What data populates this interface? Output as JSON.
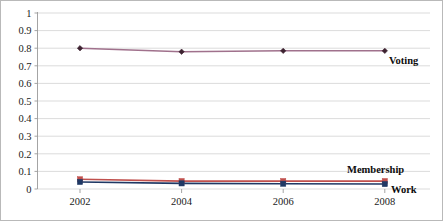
{
  "chart_data": {
    "type": "line",
    "title": "",
    "subtitle": "",
    "xlabel": "",
    "ylabel": "",
    "categories": [
      "2002",
      "2004",
      "2006",
      "2008"
    ],
    "ylim": [
      0,
      1
    ],
    "ytick_labels": [
      "0",
      "0.1",
      "0.2",
      "0.3",
      "0.4",
      "0.5",
      "0.6",
      "0.7",
      "0.8",
      "0.9",
      "1"
    ],
    "ytick_values": [
      0,
      0.1,
      0.2,
      0.3,
      0.4,
      0.5,
      0.6,
      0.7,
      0.8,
      0.9,
      1
    ],
    "grid": "horizontal",
    "legend_position": "inline-right-annotations",
    "series": [
      {
        "name": "Voting",
        "color": "#a0718c",
        "marker": "diamond",
        "marker_color": "#3d2230",
        "values": [
          0.8,
          0.78,
          0.785,
          0.785
        ]
      },
      {
        "name": "Membership",
        "color": "#c0504d",
        "marker": "square",
        "marker_color": "#c0504d",
        "values": [
          0.055,
          0.045,
          0.045,
          0.045
        ]
      },
      {
        "name": "Work",
        "color": "#1f3864",
        "marker": "square",
        "marker_color": "#1f3864",
        "values": [
          0.04,
          0.032,
          0.03,
          0.028
        ]
      }
    ],
    "annotations": [
      {
        "text": "Voting",
        "series": "Voting"
      },
      {
        "text": "Membership",
        "series": "Membership"
      },
      {
        "text": "Work",
        "series": "Work"
      }
    ]
  },
  "colors": {
    "background": "#ffffff",
    "gridline": "#d2d2d2",
    "axis": "#9a9a9a",
    "border": "#b9b9b9",
    "text": "#1a1a1a"
  }
}
